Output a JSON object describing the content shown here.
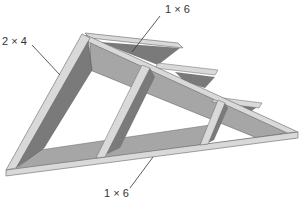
{
  "diagram": {
    "labels": {
      "top": "1 × 6",
      "left": "2 × 4",
      "bottom": "1 × 6"
    },
    "colors": {
      "edge_light": "#d9d9d9",
      "face_mid": "#a6a6a6",
      "face_dark": "#7a7a7a",
      "outline": "#555555"
    }
  }
}
